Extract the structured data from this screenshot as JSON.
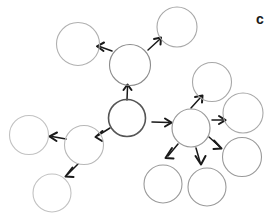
{
  "diagram": {
    "background_color": "#ffffff",
    "canvas": {
      "width": 270,
      "height": 217
    },
    "default_node_stroke": "#b3b3b3",
    "hub_node_stroke": "#4d4d4d",
    "edge_color": "#1a1a1a",
    "nodes": [
      {
        "id": "hub-center",
        "label": "",
        "cx": 127,
        "cy": 118,
        "r": 18.5,
        "stroke": "#555555",
        "stroke_width": 1.6,
        "role": "root-hub"
      },
      {
        "id": "node-top-mid",
        "label": "",
        "cx": 130,
        "cy": 65,
        "r": 20.5,
        "stroke": "#8c8c8c",
        "stroke_width": 1.1,
        "role": "branch"
      },
      {
        "id": "node-top-left",
        "label": "",
        "cx": 78,
        "cy": 44,
        "r": 21.5,
        "stroke": "#b0b0b0",
        "stroke_width": 1.1,
        "role": "leaf"
      },
      {
        "id": "node-top-right",
        "label": "",
        "cx": 177,
        "cy": 27,
        "r": 20.0,
        "stroke": "#a8a8a8",
        "stroke_width": 1.1,
        "role": "leaf"
      },
      {
        "id": "hub-right",
        "label": "",
        "cx": 191,
        "cy": 128,
        "r": 19.0,
        "stroke": "#9a9a9a",
        "stroke_width": 1.2,
        "role": "branch"
      },
      {
        "id": "node-right-up",
        "label": "",
        "cx": 212,
        "cy": 82,
        "r": 19.5,
        "stroke": "#a8a8a8",
        "stroke_width": 1.1,
        "role": "leaf"
      },
      {
        "id": "node-right-mid",
        "label": "",
        "cx": 243,
        "cy": 113,
        "r": 20.0,
        "stroke": "#a8a8a8",
        "stroke_width": 1.1,
        "role": "leaf"
      },
      {
        "id": "node-right-low",
        "label": "",
        "cx": 242,
        "cy": 157,
        "r": 19.5,
        "stroke": "#9a9a9a",
        "stroke_width": 1.1,
        "role": "leaf"
      },
      {
        "id": "node-bottom-mid",
        "label": "",
        "cx": 207,
        "cy": 187,
        "r": 19.0,
        "stroke": "#9a9a9a",
        "stroke_width": 1.1,
        "role": "leaf"
      },
      {
        "id": "node-bottom-left2",
        "label": "",
        "cx": 163,
        "cy": 184,
        "r": 19.0,
        "stroke": "#9a9a9a",
        "stroke_width": 1.1,
        "role": "leaf"
      },
      {
        "id": "hub-left",
        "label": "",
        "cx": 84,
        "cy": 145,
        "r": 19.5,
        "stroke": "#b8b8b8",
        "stroke_width": 1.1,
        "role": "branch"
      },
      {
        "id": "node-left-far",
        "label": "",
        "cx": 29,
        "cy": 135,
        "r": 19.5,
        "stroke": "#c2c2c2",
        "stroke_width": 1.1,
        "role": "leaf"
      },
      {
        "id": "node-left-low",
        "label": "",
        "cx": 52,
        "cy": 193,
        "r": 19.0,
        "stroke": "#c2c2c2",
        "stroke_width": 1.1,
        "role": "leaf"
      }
    ],
    "edges": [
      {
        "id": "edge-hub-to-topmid",
        "from": "hub-center",
        "to": "node-top-mid",
        "path": "M127,100 L127.5,87",
        "arrow": "M123.5,90 L127.5,84.5 L131.5,90"
      },
      {
        "id": "edge-topmid-to-topleft",
        "from": "node-top-mid",
        "to": "node-top-left",
        "path": "M112,51 L99.5,46.5",
        "arrow": "M104,42.5 L97,46.3 L103.5,51"
      },
      {
        "id": "edge-topmid-to-topright",
        "from": "node-top-mid",
        "to": "node-top-right",
        "path": "M148,50 L159.5,39.5",
        "arrow": "M154,39 L161,37.5 L160.5,44.5"
      },
      {
        "id": "edge-hub-to-hubright",
        "from": "hub-center",
        "to": "hub-right",
        "path": "M152,122 L169,122.5",
        "arrow": "M165,118.5 L171.5,122.6 L165,126.5"
      },
      {
        "id": "edge-hub-to-hubleft",
        "from": "hub-center",
        "to": "hub-left",
        "path": "M110,128 L98,135.5",
        "arrow": "M102.5,131 L95.5,137 L102,141"
      },
      {
        "id": "edge-hubleft-to-far",
        "from": "hub-left",
        "to": "node-left-far",
        "path": "M66,139 L52,136.5",
        "arrow": "M57,132.5 L49.5,136.3 L56.5,141"
      },
      {
        "id": "edge-hubleft-to-low",
        "from": "hub-left",
        "to": "node-left-low",
        "path": "M78,164 L68,174",
        "arrow": "M72.5,167.5 L65.5,176.5 L73.5,177"
      },
      {
        "id": "edge-hubright-to-up",
        "from": "hub-right",
        "to": "node-right-up",
        "path": "M191,108 L200.5,97.5",
        "arrow": "M195,97 L202.5,95.5 L202,102.5"
      },
      {
        "id": "edge-hubright-to-mid",
        "from": "hub-right",
        "to": "node-right-mid",
        "path": "M212,120 L223,120",
        "arrow": "M219,116 L225.5,120.2 L219,124"
      },
      {
        "id": "edge-hubright-to-low",
        "from": "hub-right",
        "to": "node-right-low",
        "path": "M209,137 L219,146",
        "arrow": "M214,140.5 L221.5,148.5 L213.5,149"
      },
      {
        "id": "edge-hubright-to-bottom",
        "from": "hub-right",
        "to": "node-bottom-mid",
        "path": "M196,148 L200,162",
        "arrow": "M195.5,156 L201,164.5 L205.5,156"
      },
      {
        "id": "edge-hubright-to-bleft",
        "from": "hub-right",
        "to": "node-bottom-left2",
        "path": "M178,144 L168,156",
        "arrow": "M172,148 L165.5,158 L173.5,158.5"
      }
    ],
    "corner_mark": {
      "id": "corner-glyph",
      "symbol": "c",
      "x": 256,
      "y": 12,
      "font_size": 14,
      "color": "#1a1a1a"
    }
  }
}
